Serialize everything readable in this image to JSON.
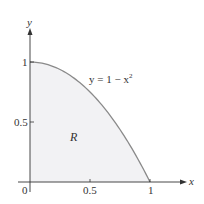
{
  "chart_data": {
    "type": "area",
    "title": "",
    "xlabel": "x",
    "ylabel": "y",
    "xlim": [
      0,
      1.25
    ],
    "ylim": [
      0,
      1.2
    ],
    "grid": false,
    "x_ticks": [
      "0",
      "0.5",
      "1"
    ],
    "y_ticks": [
      "0.5",
      "1"
    ],
    "series": [
      {
        "name": "y = 1 − x²",
        "equation": "y = 1 - x^2",
        "x": [
          0,
          0.1,
          0.2,
          0.3,
          0.4,
          0.5,
          0.6,
          0.7,
          0.8,
          0.9,
          1.0
        ],
        "y": [
          1,
          0.99,
          0.96,
          0.91,
          0.84,
          0.75,
          0.64,
          0.51,
          0.36,
          0.19,
          0
        ]
      }
    ],
    "annotations": [
      {
        "text": "R",
        "meaning": "shaded region under curve",
        "x": 0.32,
        "y": 0.34
      },
      {
        "text": "y = 1 − x",
        "superscript": "2",
        "x": 0.62,
        "y": 0.9
      }
    ],
    "colors": {
      "curve": "#8a8a8a",
      "fill": "#f2f2f4",
      "axes": "#333333"
    }
  },
  "labels": {
    "x_axis": "x",
    "y_axis": "y",
    "origin": "0",
    "x_tick_half": "0.5",
    "x_tick_one": "1",
    "y_tick_half": "0.5",
    "y_tick_one": "1",
    "curve_label_main": "y = 1 − x",
    "curve_label_sup": "2",
    "region_label": "R"
  }
}
